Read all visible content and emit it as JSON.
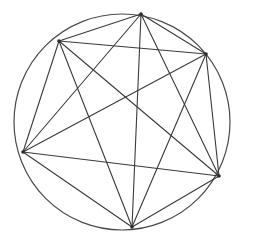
{
  "figure": {
    "background_color": "#ffffff",
    "stroke_color": "#3a3a3a",
    "circle_stroke_color": "#4a4a4a",
    "vertex_color": "#2b2b2b",
    "stroke_width": 1.1,
    "circle_stroke_width": 1.2,
    "vertex_radius": 1.8,
    "canvas": {
      "width": 254,
      "height": 243
    },
    "circle": {
      "cx": 122,
      "cy": 122,
      "r": 108
    },
    "vertex_count": 6,
    "edge_count": 15,
    "vertices": [
      {
        "id": "v0",
        "label": "top",
        "x": 141,
        "y": 14
      },
      {
        "id": "v1",
        "label": "upper-right",
        "x": 206,
        "y": 54
      },
      {
        "id": "v2",
        "label": "right",
        "x": 219,
        "y": 176
      },
      {
        "id": "v3",
        "label": "bottom",
        "x": 132,
        "y": 227
      },
      {
        "id": "v4",
        "label": "left",
        "x": 23,
        "y": 152
      },
      {
        "id": "v5",
        "label": "upper-left",
        "x": 59,
        "y": 41
      }
    ],
    "edges": [
      {
        "from": "v0",
        "to": "v1"
      },
      {
        "from": "v0",
        "to": "v2"
      },
      {
        "from": "v0",
        "to": "v3"
      },
      {
        "from": "v0",
        "to": "v4"
      },
      {
        "from": "v0",
        "to": "v5"
      },
      {
        "from": "v1",
        "to": "v2"
      },
      {
        "from": "v1",
        "to": "v3"
      },
      {
        "from": "v1",
        "to": "v4"
      },
      {
        "from": "v1",
        "to": "v5"
      },
      {
        "from": "v2",
        "to": "v3"
      },
      {
        "from": "v2",
        "to": "v4"
      },
      {
        "from": "v2",
        "to": "v5"
      },
      {
        "from": "v3",
        "to": "v4"
      },
      {
        "from": "v3",
        "to": "v5"
      },
      {
        "from": "v4",
        "to": "v5"
      }
    ]
  }
}
